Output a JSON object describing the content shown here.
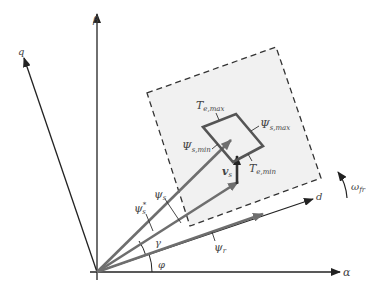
{
  "diagram": {
    "type": "vector-diagram",
    "axes": {
      "alpha": {
        "label": "α"
      },
      "beta": {
        "label": "β"
      },
      "d": {
        "label": "d"
      },
      "q": {
        "label": "q"
      }
    },
    "vectors": {
      "psi_s": {
        "label": "ψ",
        "sub": "s"
      },
      "psi_s_ref": {
        "label": "ψ",
        "sub": "s",
        "sup": "*"
      },
      "psi_r": {
        "label": "ψ",
        "sub": "r"
      },
      "v_s": {
        "label": "v",
        "sub": "s"
      }
    },
    "angles": {
      "gamma": {
        "label": "γ"
      },
      "phi": {
        "label": "φ"
      }
    },
    "rotation": {
      "label": "ω",
      "sub": "fr"
    },
    "limits": {
      "T_e_max": {
        "label": "T",
        "sub": "e,max"
      },
      "T_e_min": {
        "label": "T",
        "sub": "e,min"
      },
      "Psi_s_max": {
        "label": "Ψ",
        "sub": "s,max"
      },
      "Psi_s_min": {
        "label": "Ψ",
        "sub": "s,min"
      }
    },
    "colors": {
      "axis": "#222222",
      "vector": "#6e6e6e",
      "limit_box": "#555555",
      "fill": "#f1f1f1",
      "dash": "#333333"
    }
  }
}
